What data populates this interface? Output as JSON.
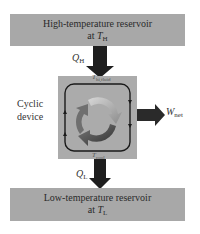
{
  "diagram": {
    "high_reservoir": {
      "line1": "High-temperature reservoir",
      "line2_prefix": "at ",
      "symbol": "T",
      "subscript": "H"
    },
    "low_reservoir": {
      "line1": "Low-temperature reservoir",
      "line2_prefix": "at ",
      "symbol": "T",
      "subscript": "L"
    },
    "device": {
      "label_line1": "Cyclic",
      "label_line2": "device",
      "top_temp_symbol": "T",
      "top_temp_sub": "hi,fluid",
      "bottom_temp_symbol": "T",
      "bottom_temp_sub": "cool"
    },
    "flows": {
      "heat_in": {
        "symbol": "Q",
        "subscript": "H"
      },
      "heat_out": {
        "symbol": "Q",
        "subscript": "L"
      },
      "work_out": {
        "symbol": "W",
        "subscript": "net"
      }
    },
    "colors": {
      "reservoir_fill": "#a8a8a8",
      "device_fill": "#ababab",
      "arrow": "#1e1e1e",
      "loop_line": "#1a1a1a",
      "cycle_arrow_light": "#c8c8c8",
      "cycle_arrow_dark": "#3a3a3a"
    }
  }
}
